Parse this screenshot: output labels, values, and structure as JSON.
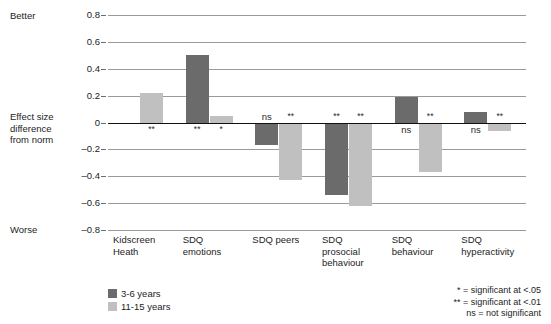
{
  "labels": {
    "better": "Better",
    "worse": "Worse",
    "axis_title": "Effect size\ndifference\nfrom norm"
  },
  "legend": {
    "position": "bottom-left",
    "items": [
      {
        "label": "3-6 years",
        "color": "#6b6b6b",
        "key": "dark"
      },
      {
        "label": "11-15 years",
        "color": "#c0c0c0",
        "key": "light"
      }
    ]
  },
  "footnote": [
    "* = significant at <.05",
    "** = significant at <.01",
    "ns = not significant"
  ],
  "chart_data": {
    "type": "bar",
    "title": "",
    "xlabel": "",
    "ylabel": "Effect size difference from norm",
    "ylim": [
      -0.8,
      0.8
    ],
    "yticks": [
      0.8,
      0.6,
      0.4,
      0.2,
      0,
      -0.2,
      -0.4,
      -0.6,
      -0.8
    ],
    "ytick_labels": [
      "0.8",
      "0.6",
      "0.4",
      "0.2",
      "0",
      "–0.2",
      "–0.4",
      "–0.6",
      "–0.8"
    ],
    "grid": true,
    "categories": [
      "Kidscreen\nHeath",
      "SDQ\nemotions",
      "SDQ peers",
      "SDQ\nprosocial\nbehaviour",
      "SDQ\nbehaviour",
      "SDQ\nhyperactivity"
    ],
    "series": [
      {
        "name": "3-6 years",
        "color": "#6b6b6b",
        "values": [
          null,
          0.5,
          -0.17,
          -0.54,
          0.19,
          0.08
        ],
        "significance": [
          "",
          "**",
          "ns",
          "**",
          "ns",
          "ns"
        ]
      },
      {
        "name": "11-15 years",
        "color": "#c0c0c0",
        "values": [
          0.22,
          0.05,
          -0.43,
          -0.62,
          -0.37,
          -0.06
        ],
        "significance": [
          "**",
          "*",
          "**",
          "**",
          "**",
          "**"
        ]
      }
    ]
  }
}
